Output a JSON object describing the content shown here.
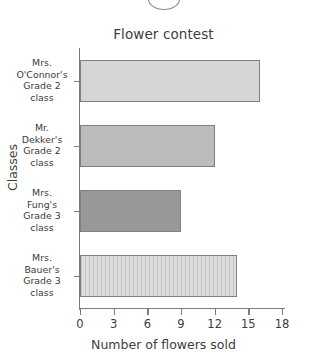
{
  "decor": {
    "top_artifact_name": "clipped-circle-artifact"
  },
  "chart_data": {
    "type": "bar",
    "orientation": "horizontal",
    "title": "Flower contest",
    "xlabel": "Number of flowers sold",
    "ylabel": "Classes",
    "categories": [
      "Mrs. O'Connor's Grade 2 class",
      "Mr. Dekker's Grade 2 class",
      "Mrs. Fung's Grade 3 class",
      "Mrs. Bauer's Grade 3 class"
    ],
    "category_lines": [
      [
        "Mrs.",
        "O'Connor's",
        "Grade 2",
        "class"
      ],
      [
        "Mr.",
        "Dekker's",
        "Grade 2",
        "class"
      ],
      [
        "Mrs.",
        "Fung's",
        "Grade 3",
        "class"
      ],
      [
        "Mrs.",
        "Bauer's",
        "Grade 3",
        "class"
      ]
    ],
    "values": [
      16,
      12,
      9,
      14
    ],
    "bar_colors": [
      "#d6d6d6",
      "#bcbcbc",
      "#989898",
      "#dedede"
    ],
    "bar_patterns": [
      "solid",
      "solid",
      "solid",
      "vertical-stripes"
    ],
    "bar_border_color": "#808080",
    "xlim": [
      0,
      18
    ],
    "xticks": [
      0,
      3,
      6,
      9,
      12,
      15,
      18
    ],
    "xtick_labels": [
      "0",
      "3",
      "6",
      "9",
      "12",
      "15",
      "18"
    ],
    "grid": false,
    "legend": false,
    "axis_color": "#7d7d7d",
    "text_color": "#3c3c3c",
    "background": "#ffffff"
  }
}
